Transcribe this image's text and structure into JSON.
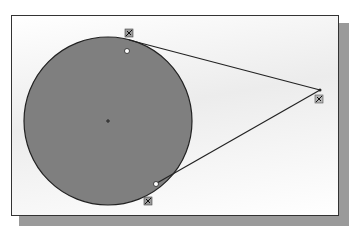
{
  "diagram": {
    "circle": {
      "cx": 108,
      "cy": 121,
      "r": 84,
      "fill": "#7f7f7f",
      "stroke": "#222222"
    },
    "center_mark": {
      "x": 108,
      "y": 121
    },
    "external_point": {
      "x": 320,
      "y": 90
    },
    "tangent_points": [
      {
        "x": 129,
        "y": 39
      },
      {
        "x": 157,
        "y": 183
      }
    ],
    "constraint_markers": [
      {
        "name": "tangent-constraint-top",
        "x": 129,
        "y": 33
      },
      {
        "name": "coincident-constraint-top",
        "x": 127,
        "y": 51
      },
      {
        "name": "tangent-constraint-bottom",
        "x": 148,
        "y": 201
      },
      {
        "name": "coincident-constraint-bottom",
        "x": 156,
        "y": 184
      },
      {
        "name": "endpoint-constraint-right",
        "x": 319,
        "y": 99
      }
    ]
  }
}
